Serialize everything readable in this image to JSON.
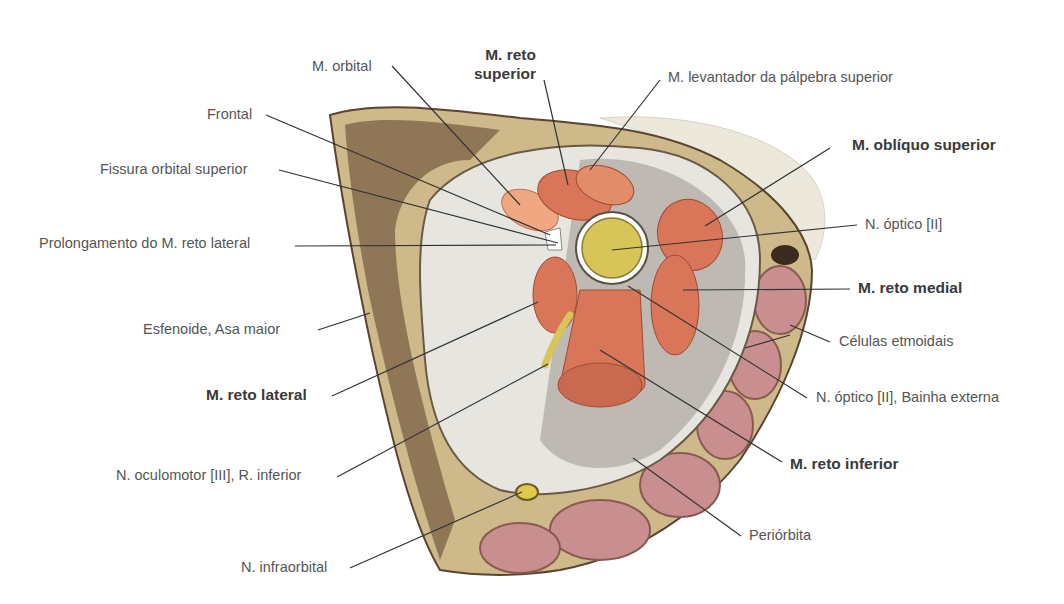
{
  "figure": {
    "colors": {
      "bone": "#cdb98a",
      "bone_dark": "#5a4530",
      "periorbita_bg": "#d9d6cf",
      "muscle": "#d9765a",
      "muscle_dark": "#b85a40",
      "nerve": "#d8c55a",
      "ethmoid_cells": "#c98f90",
      "fat": "#ece8dc",
      "leader_line": "#333333",
      "label_text": "#555555"
    }
  },
  "labels": {
    "m_orbital": "M. orbital",
    "m_reto_superior_1": "M. reto",
    "m_reto_superior_2": "superior",
    "m_levantador": "M. levantador da pálpebra superior",
    "frontal": "Frontal",
    "m_obliquo_superior": "M. oblíquo superior",
    "fissura_orbital_superior": "Fissura orbital superior",
    "n_optico": "N. óptico [II]",
    "prolongamento": "Prolongamento do M. reto lateral",
    "m_reto_medial": "M. reto medial",
    "esfenoide": "Esfenoide, Asa maior",
    "celulas_etmoidais": "Células etmoidais",
    "m_reto_lateral": "M. reto lateral",
    "n_optico_bainha": "N. óptico [II], Bainha externa",
    "m_reto_inferior": "M. reto inferior",
    "n_oculomotor": "N. oculomotor [III], R. inferior",
    "periorbita": "Periórbita",
    "n_infraorbital": "N. infraorbital"
  }
}
